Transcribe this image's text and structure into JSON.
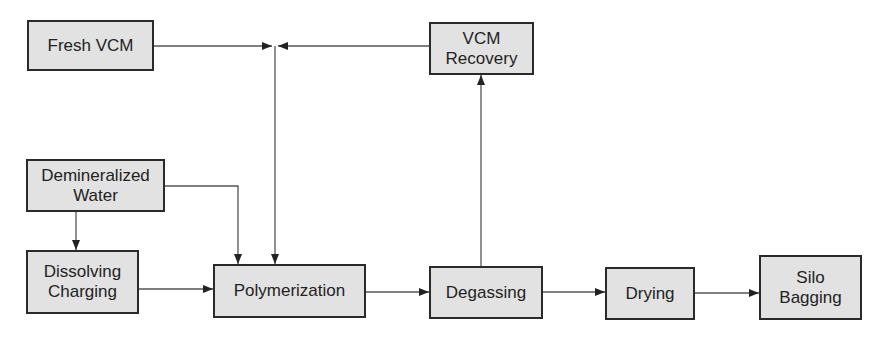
{
  "diagram": {
    "type": "process-flow",
    "nodes": [
      {
        "id": "fresh_vcm",
        "label": "Fresh VCM"
      },
      {
        "id": "vcm_recovery",
        "label": "VCM\nRecovery"
      },
      {
        "id": "demin_water",
        "label": "Demineralized\nWater"
      },
      {
        "id": "dissolving",
        "label": "Dissolving\nCharging"
      },
      {
        "id": "polymerization",
        "label": "Polymerization"
      },
      {
        "id": "degassing",
        "label": "Degassing"
      },
      {
        "id": "drying",
        "label": "Drying"
      },
      {
        "id": "silo",
        "label": "Silo\nBagging"
      }
    ],
    "edges": [
      {
        "from": "fresh_vcm",
        "to": "polymerization"
      },
      {
        "from": "vcm_recovery",
        "to": "polymerization"
      },
      {
        "from": "demin_water",
        "to": "dissolving"
      },
      {
        "from": "demin_water",
        "to": "polymerization"
      },
      {
        "from": "dissolving",
        "to": "polymerization"
      },
      {
        "from": "polymerization",
        "to": "degassing"
      },
      {
        "from": "degassing",
        "to": "vcm_recovery"
      },
      {
        "from": "degassing",
        "to": "drying"
      },
      {
        "from": "drying",
        "to": "silo"
      }
    ]
  }
}
